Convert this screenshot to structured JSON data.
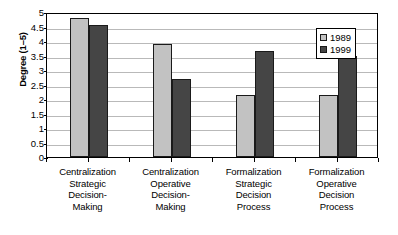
{
  "chart_data": {
    "type": "bar",
    "title": "",
    "xlabel": "",
    "ylabel": "Degree (1–5)",
    "ylim": [
      0,
      5
    ],
    "ytick_step": 0.5,
    "ytick_labels": [
      "0",
      "0.5",
      "1",
      "1.5",
      "2",
      "2.5",
      "3",
      "3.5",
      "4",
      "4.5",
      "5"
    ],
    "ytick_values": [
      0,
      0.5,
      1,
      1.5,
      2,
      2.5,
      3,
      3.5,
      4,
      4.5,
      5
    ],
    "grid": true,
    "grid_axis": "y",
    "legend_position": "top-right",
    "categories": [
      "Centralization Strategic Decision-Making",
      "Centralization Operative Decision-Making",
      "Formalization Strategic Decision Process",
      "Formalization Operative Decision Process"
    ],
    "category_lines": [
      [
        "Centralization",
        "Strategic",
        "Decision-",
        "Making"
      ],
      [
        "Centralization",
        "Operative",
        "Decision-",
        "Making"
      ],
      [
        "Formalization",
        "Strategic",
        "Decision",
        "Process"
      ],
      [
        "Formalization",
        "Operative",
        "Decision",
        "Process"
      ]
    ],
    "series": [
      {
        "name": "1989",
        "color": "#c2c2c2",
        "values": [
          4.8,
          3.9,
          2.15,
          2.15
        ]
      },
      {
        "name": "1999",
        "color": "#454545",
        "values": [
          4.55,
          2.68,
          3.65,
          3.5
        ]
      }
    ]
  },
  "legend": {
    "items": [
      {
        "label": "1989"
      },
      {
        "label": "1999"
      }
    ]
  },
  "colors": {
    "series_1989": "#c2c2c2",
    "series_1999": "#454545",
    "gridline": "#b9b9b9",
    "axis": "#000000",
    "background": "#ffffff"
  }
}
